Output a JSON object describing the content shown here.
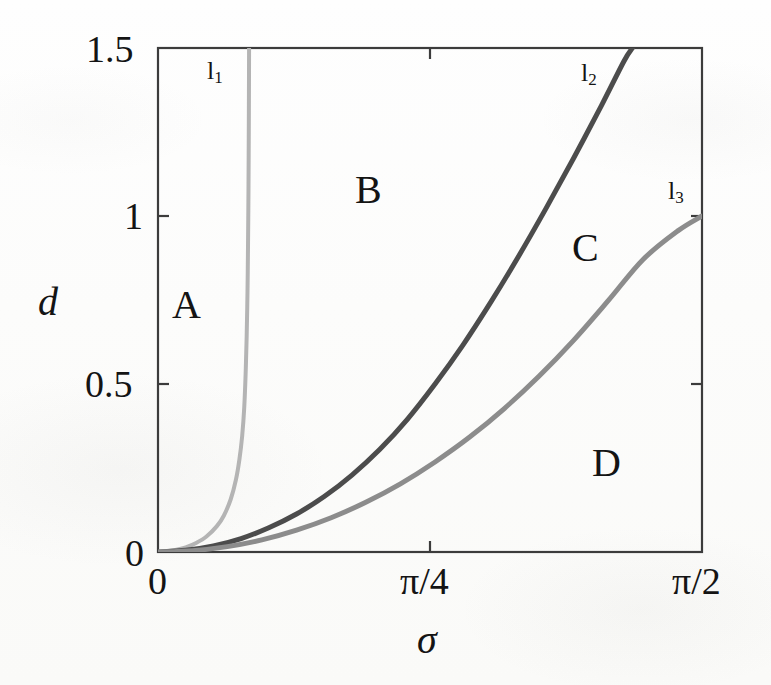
{
  "figure": {
    "background_color": "#fdfdfc",
    "axis_color": "#3c3c3c"
  },
  "axes": {
    "x_title": "σ",
    "y_title": "d",
    "x_tick_labels": [
      "0",
      "π/4",
      "π/2"
    ],
    "y_tick_labels": [
      "0",
      "0.5",
      "1",
      "1.5"
    ]
  },
  "region_labels": [
    {
      "text": "A",
      "x": 172,
      "y": 285
    },
    {
      "text": "B",
      "x": 355,
      "y": 170
    },
    {
      "text": "C",
      "x": 572,
      "y": 228
    },
    {
      "text": "D",
      "x": 592,
      "y": 443
    }
  ],
  "curve_labels": [
    {
      "text": "l",
      "sub": "1",
      "x": 203,
      "y": 58
    },
    {
      "text": "l",
      "sub": "2",
      "x": 578,
      "y": 60
    },
    {
      "text": "l",
      "sub": "3",
      "x": 665,
      "y": 178
    }
  ],
  "chart_data": {
    "type": "line",
    "title": "",
    "xlabel": "σ",
    "ylabel": "d",
    "xlim": [
      0,
      1.5707963
    ],
    "ylim": [
      0,
      1.5
    ],
    "xticks": [
      0,
      0.7853982,
      1.5707963
    ],
    "xticklabels": [
      "0",
      "π/4",
      "π/2"
    ],
    "yticks": [
      0,
      0.5,
      1,
      1.5
    ],
    "yticklabels": [
      "0",
      "0.5",
      "1",
      "1.5"
    ],
    "grid": false,
    "legend": "none",
    "series": [
      {
        "name": "l1",
        "color": "#b4b4b4",
        "width": 4,
        "points": [
          [
            0.0,
            0.0
          ],
          [
            0.02,
            0.0015
          ],
          [
            0.05,
            0.006
          ],
          [
            0.08,
            0.014
          ],
          [
            0.11,
            0.027
          ],
          [
            0.14,
            0.046
          ],
          [
            0.17,
            0.077
          ],
          [
            0.19,
            0.108
          ],
          [
            0.21,
            0.157
          ],
          [
            0.225,
            0.215
          ],
          [
            0.235,
            0.275
          ],
          [
            0.243,
            0.345
          ],
          [
            0.249,
            0.43
          ],
          [
            0.253,
            0.53
          ],
          [
            0.256,
            0.64
          ],
          [
            0.2585,
            0.78
          ],
          [
            0.26,
            0.92
          ],
          [
            0.2612,
            1.07
          ],
          [
            0.262,
            1.22
          ],
          [
            0.2626,
            1.37
          ],
          [
            0.263,
            1.5
          ]
        ]
      },
      {
        "name": "l2",
        "color": "#4c4c4c",
        "width": 5,
        "points": [
          [
            0.0,
            0.0
          ],
          [
            0.08,
            0.005
          ],
          [
            0.16,
            0.018
          ],
          [
            0.24,
            0.04
          ],
          [
            0.32,
            0.072
          ],
          [
            0.4,
            0.113
          ],
          [
            0.48,
            0.165
          ],
          [
            0.56,
            0.229
          ],
          [
            0.64,
            0.305
          ],
          [
            0.72,
            0.395
          ],
          [
            0.8,
            0.5
          ],
          [
            0.88,
            0.615
          ],
          [
            0.96,
            0.742
          ],
          [
            1.04,
            0.878
          ],
          [
            1.12,
            1.022
          ],
          [
            1.2,
            1.172
          ],
          [
            1.28,
            1.328
          ],
          [
            1.345,
            1.46
          ],
          [
            1.37,
            1.5
          ]
        ]
      },
      {
        "name": "l3",
        "color": "#8c8c8c",
        "width": 5,
        "points": [
          [
            0.0,
            0.0
          ],
          [
            0.1,
            0.004
          ],
          [
            0.2,
            0.016
          ],
          [
            0.3,
            0.036
          ],
          [
            0.4,
            0.065
          ],
          [
            0.5,
            0.102
          ],
          [
            0.6,
            0.148
          ],
          [
            0.7,
            0.203
          ],
          [
            0.8,
            0.268
          ],
          [
            0.9,
            0.342
          ],
          [
            1.0,
            0.427
          ],
          [
            1.1,
            0.523
          ],
          [
            1.2,
            0.63
          ],
          [
            1.3,
            0.748
          ],
          [
            1.4,
            0.87
          ],
          [
            1.4999,
            0.955
          ],
          [
            1.5707963,
            1.0
          ]
        ]
      }
    ],
    "annotations": [
      {
        "text": "A",
        "x": 0.04,
        "y": 0.77
      },
      {
        "text": "B",
        "x": 0.56,
        "y": 1.12
      },
      {
        "text": "C",
        "x": 1.17,
        "y": 0.93
      },
      {
        "text": "D",
        "x": 1.23,
        "y": 0.3
      },
      {
        "text": "l1",
        "x": 0.27,
        "y": 1.44
      },
      {
        "text": "l2",
        "x": 1.21,
        "y": 1.43
      },
      {
        "text": "l3",
        "x": 1.46,
        "y": 1.13
      }
    ]
  },
  "geometry": {
    "plot_left": 158,
    "plot_right": 702,
    "plot_top": 48,
    "plot_bottom": 552
  }
}
